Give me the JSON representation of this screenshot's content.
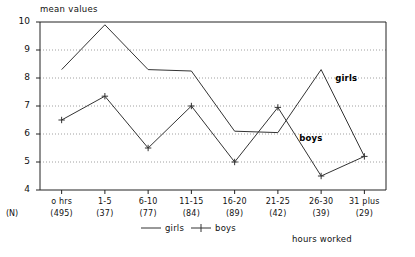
{
  "chart_data": {
    "type": "line",
    "title": "",
    "ylabel": "mean values",
    "xlabel": "hours worked",
    "ylim": [
      4,
      10
    ],
    "yticks": [
      4,
      5,
      6,
      7,
      8,
      9,
      10
    ],
    "grid": true,
    "grid_style": "dotted-horizontal",
    "legend_position": "bottom-center",
    "categories": [
      "o hrs",
      "1-5",
      "6-10",
      "11-15",
      "16-20",
      "21-25",
      "26-30",
      "31 plus"
    ],
    "n_label": "(N)",
    "n_counts": [
      "(495)",
      "(37)",
      "(77)",
      "(84)",
      "(89)",
      "(42)",
      "(39)",
      "(29)"
    ],
    "series": [
      {
        "name": "girls",
        "marker": "none",
        "color": "#333333",
        "values": [
          8.3,
          9.9,
          8.3,
          8.25,
          6.1,
          6.05,
          8.3,
          5.2
        ]
      },
      {
        "name": "boys",
        "marker": "plus",
        "color": "#333333",
        "values": [
          6.5,
          7.35,
          5.5,
          7.0,
          5.0,
          6.95,
          4.5,
          5.2
        ]
      }
    ],
    "annotations": [
      {
        "text": "girls",
        "series": "girls"
      },
      {
        "text": "boys",
        "series": "boys"
      }
    ]
  },
  "legend": {
    "entries": [
      {
        "label": "girls",
        "marker": "line"
      },
      {
        "label": "boys",
        "marker": "line-plus"
      }
    ]
  }
}
